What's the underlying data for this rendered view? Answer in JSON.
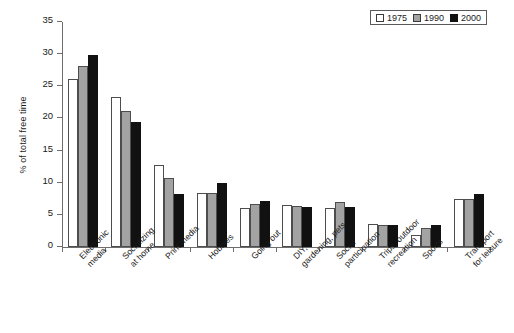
{
  "chart_data": {
    "type": "bar",
    "title": "",
    "subtitle": "",
    "xlabel": "",
    "ylabel": "% of total free time",
    "ylim": [
      0,
      35
    ],
    "ytick_values": [
      0,
      5,
      10,
      15,
      20,
      25,
      30,
      35
    ],
    "ytick_labels": [
      "0",
      "5",
      "10",
      "15",
      "20",
      "25",
      "30",
      "35"
    ],
    "grid": false,
    "legend_position": "top-right",
    "categories": [
      "Electronic\nmedia",
      "Socializing\nat home",
      "Print media",
      "Hobbies",
      "Going out",
      "DIY,\ngardening, pets",
      "Social\nparticipation",
      "Trips, outdoor\nrecreation",
      "Sports",
      "Transport\nfor leisure"
    ],
    "series": [
      {
        "name": "1975",
        "color": "#ffffff",
        "values": [
          26.1,
          23.4,
          12.8,
          8.4,
          6.1,
          6.5,
          6.1,
          3.6,
          1.8,
          7.4
        ]
      },
      {
        "name": "1990",
        "color": "#a3a3a3",
        "values": [
          28.2,
          21.2,
          10.8,
          8.4,
          6.7,
          6.4,
          7.0,
          3.4,
          2.9,
          7.5
        ]
      },
      {
        "name": "2000",
        "color": "#111111",
        "values": [
          29.8,
          19.5,
          8.3,
          10.0,
          7.1,
          6.2,
          6.2,
          3.4,
          3.4,
          8.3
        ]
      }
    ]
  },
  "legend": {
    "items": [
      {
        "label": "1975"
      },
      {
        "label": "1990"
      },
      {
        "label": "2000"
      }
    ]
  }
}
